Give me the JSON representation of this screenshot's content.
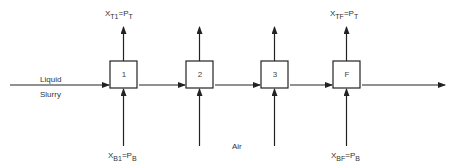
{
  "diagram": {
    "type": "countercurrent flow stages",
    "feed": {
      "line1": "Liquid",
      "line2": "Slurry"
    },
    "air_label": "Air",
    "stages": [
      {
        "id": "1",
        "label": "1",
        "top": {
          "x": "X",
          "xsub": "T1",
          "eq": "=",
          "p": "P",
          "psub": "T"
        },
        "bottom": {
          "x": "X",
          "xsub": "B1",
          "eq": "=",
          "p": "P",
          "psub": "B"
        }
      },
      {
        "id": "2",
        "label": "2"
      },
      {
        "id": "3",
        "label": "3"
      },
      {
        "id": "F",
        "label": "F",
        "top": {
          "x": "X",
          "xsub": "TF",
          "eq": "=",
          "p": "P",
          "psub": "T"
        },
        "bottom": {
          "x": "X",
          "xsub": "BF",
          "eq": "=",
          "p": "P",
          "psub": "B"
        }
      }
    ],
    "colors": {
      "line": "#222222",
      "text": "#333333",
      "background": "#ffffff"
    }
  }
}
